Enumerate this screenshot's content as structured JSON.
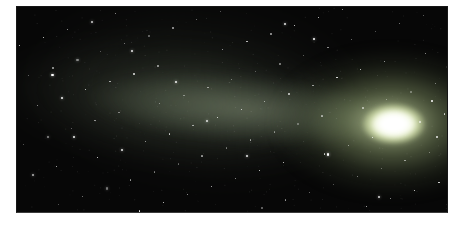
{
  "image": {
    "description": "Telescope photograph of a comet: a bright white-green coma on the right with a broad, diffuse gray-green tail fanning toward the upper left, set against a black sky densely speckled with faint stars. The photo sits inset on a white page with white margins.",
    "type": "astronomy-photograph",
    "subject": "comet"
  },
  "colors": {
    "page_bg": "#ffffff",
    "sky": "#070707",
    "tail_haze": "rgba(90,104,82,0.20)",
    "tail_outer": "rgba(106,120,96,0.30)",
    "tail_inner": "rgba(150,164,134,0.48)",
    "glow_inner": "rgba(210,224,174,0.88)",
    "glow_mid": "rgba(142,160,110,0.50)",
    "glow_outer": "rgba(70,82,55,0.25)",
    "coma_core": "#ffffff",
    "coma_mid": "#f3f8e3",
    "coma_edge": "rgba(205,218,165,0.85)",
    "star": "#ffffff"
  },
  "photo": {
    "frame": {
      "left": 16,
      "top": 6,
      "width": 432,
      "height": 207
    },
    "coma": {
      "cx": 378,
      "cy": 117,
      "core_w": 66,
      "core_h": 42,
      "core_blur": 2,
      "glow_cx": 368,
      "glow_cy": 115,
      "glow_w": 310,
      "glow_h": 195,
      "glow_blur": 6
    },
    "tail": {
      "inner": {
        "w": 430,
        "h": 96,
        "end_x": 392,
        "end_y": 115,
        "angle": 4.5,
        "blur": 6
      },
      "outer": {
        "w": 535,
        "h": 180,
        "end_x": 405,
        "end_y": 119,
        "angle": 5.5,
        "blur": 11
      },
      "haze": {
        "w": 480,
        "h": 250,
        "end_x": 396,
        "end_y": 110,
        "angle": 6.5,
        "blur": 16
      }
    }
  },
  "stars": [
    [
      61.8,
      75.5,
      1.1,
      0.9
    ],
    [
      23.6,
      51.0,
      1.1,
      0.5
    ],
    [
      85.4,
      26.5,
      1.1,
      0.7
    ],
    [
      47.2,
      2.0,
      1.1,
      0.4
    ],
    [
      9.0,
      77.4,
      1.5,
      0.8
    ],
    [
      70.8,
      52.9,
      1.1,
      0.55
    ],
    [
      32.6,
      28.4,
      1.8,
      0.65
    ],
    [
      94.4,
      3.9,
      1.1,
      0.45
    ],
    [
      56.2,
      79.4,
      1.1,
      0.95
    ],
    [
      18.0,
      54.9,
      1.5,
      0.6
    ],
    [
      79.8,
      30.4,
      1.1,
      0.9
    ],
    [
      41.6,
      5.9,
      1.1,
      0.5
    ],
    [
      3.4,
      81.3,
      2.2,
      0.7
    ],
    [
      65.2,
      56.8,
      1.8,
      0.4
    ],
    [
      27.0,
      32.3,
      1.5,
      0.8
    ],
    [
      88.9,
      7.8,
      1.1,
      0.55
    ],
    [
      50.7,
      83.3,
      1.1,
      0.65
    ],
    [
      12.5,
      58.8,
      1.1,
      0.45
    ],
    [
      74.3,
      34.3,
      1.1,
      0.95
    ],
    [
      36.1,
      9.8,
      1.5,
      0.6
    ],
    [
      97.9,
      85.2,
      1.8,
      0.9
    ],
    [
      59.7,
      60.7,
      1.1,
      0.5
    ],
    [
      21.5,
      36.2,
      1.1,
      0.7
    ],
    [
      83.3,
      11.7,
      1.1,
      0.4
    ],
    [
      45.1,
      87.2,
      1.5,
      0.8
    ],
    [
      6.9,
      62.7,
      2.2,
      0.55
    ],
    [
      68.7,
      38.2,
      1.1,
      0.65
    ],
    [
      30.5,
      13.7,
      1.8,
      0.45
    ],
    [
      92.3,
      89.1,
      1.1,
      0.95
    ],
    [
      54.1,
      64.6,
      1.5,
      0.6
    ],
    [
      15.9,
      40.1,
      1.1,
      0.9
    ],
    [
      77.7,
      15.6,
      1.1,
      0.5
    ],
    [
      39.5,
      91.1,
      1.1,
      0.7
    ],
    [
      1.3,
      66.6,
      1.1,
      0.4
    ],
    [
      63.1,
      42.1,
      1.8,
      0.8
    ],
    [
      24.9,
      17.6,
      1.1,
      0.55
    ],
    [
      86.7,
      93.0,
      1.1,
      0.65
    ],
    [
      48.5,
      68.5,
      1.1,
      0.45
    ],
    [
      10.3,
      44.0,
      2.2,
      0.95
    ],
    [
      72.1,
      19.5,
      1.5,
      0.6
    ],
    [
      33.9,
      95.0,
      1.1,
      0.9
    ],
    [
      95.7,
      70.5,
      1.8,
      0.5
    ],
    [
      57.5,
      46.0,
      1.1,
      0.7
    ],
    [
      19.3,
      21.5,
      1.1,
      0.4
    ],
    [
      81.1,
      96.9,
      1.5,
      0.8
    ],
    [
      42.9,
      72.4,
      1.1,
      0.55
    ],
    [
      4.7,
      47.9,
      1.1,
      0.65
    ],
    [
      66.5,
      23.4,
      1.1,
      0.45
    ],
    [
      28.3,
      98.9,
      1.8,
      0.95
    ],
    [
      90.1,
      74.4,
      1.5,
      0.6
    ],
    [
      52.0,
      49.9,
      1.1,
      0.9
    ],
    [
      13.8,
      25.4,
      2.2,
      0.5
    ],
    [
      75.6,
      0.9,
      1.1,
      0.7
    ],
    [
      37.4,
      76.3,
      1.1,
      0.4
    ],
    [
      99.2,
      51.8,
      1.5,
      0.8
    ],
    [
      61.0,
      27.3,
      1.8,
      0.55
    ],
    [
      22.8,
      2.8,
      1.1,
      0.65
    ],
    [
      84.6,
      78.3,
      1.1,
      0.45
    ],
    [
      46.4,
      53.8,
      1.1,
      0.95
    ],
    [
      8.2,
      29.3,
      1.5,
      0.6
    ],
    [
      70.0,
      4.8,
      1.1,
      0.9
    ],
    [
      31.8,
      80.2,
      1.1,
      0.5
    ],
    [
      93.6,
      55.7,
      1.8,
      0.7
    ],
    [
      55.4,
      31.2,
      1.1,
      0.4
    ],
    [
      17.2,
      6.7,
      2.2,
      0.8
    ],
    [
      79.0,
      82.2,
      1.1,
      0.55
    ],
    [
      40.8,
      57.7,
      1.1,
      0.65
    ],
    [
      2.6,
      33.2,
      1.1,
      0.45
    ],
    [
      64.4,
      8.7,
      1.1,
      0.95
    ],
    [
      26.2,
      84.1,
      1.8,
      0.6
    ],
    [
      88.0,
      59.6,
      1.1,
      0.9
    ],
    [
      49.8,
      35.1,
      1.1,
      0.5
    ],
    [
      11.6,
      10.6,
      1.1,
      0.7
    ],
    [
      73.5,
      86.1,
      1.1,
      0.4
    ],
    [
      35.3,
      61.6,
      1.5,
      0.8
    ],
    [
      97.1,
      37.1,
      1.1,
      0.55
    ],
    [
      58.9,
      12.6,
      1.8,
      0.65
    ],
    [
      20.7,
      88.0,
      2.2,
      0.45
    ],
    [
      82.5,
      63.5,
      1.1,
      0.95
    ],
    [
      44.3,
      39.0,
      1.5,
      0.6
    ],
    [
      6.1,
      14.5,
      1.1,
      0.9
    ],
    [
      67.9,
      90.0,
      1.1,
      0.5
    ],
    [
      29.7,
      65.5,
      1.1,
      0.7
    ],
    [
      91.5,
      41.0,
      1.8,
      0.4
    ],
    [
      53.3,
      16.5,
      1.5,
      0.8
    ],
    [
      15.1,
      92.0,
      1.1,
      0.55
    ],
    [
      76.9,
      67.4,
      1.1,
      0.65
    ],
    [
      38.7,
      42.9,
      1.1,
      0.45
    ],
    [
      0.5,
      18.4,
      1.1,
      0.95
    ],
    [
      62.3,
      93.9,
      1.5,
      0.6
    ],
    [
      24.1,
      69.4,
      2.2,
      0.9
    ],
    [
      85.9,
      44.9,
      1.1,
      0.5
    ],
    [
      47.7,
      20.4,
      1.1,
      0.7
    ],
    [
      9.5,
      95.9,
      1.1,
      0.4
    ],
    [
      71.3,
      71.3,
      1.5,
      0.8
    ],
    [
      33.1,
      46.8,
      1.1,
      0.55
    ],
    [
      94.9,
      22.3,
      1.1,
      0.65
    ],
    [
      56.7,
      97.8,
      1.8,
      0.45
    ],
    [
      18.5,
      73.3,
      1.1,
      0.95
    ],
    [
      80.3,
      48.8,
      1.5,
      0.6
    ],
    [
      7.9,
      32.5,
      2.6,
      1
    ],
    [
      68.8,
      15.0,
      2.4,
      1
    ],
    [
      36.8,
      35.9,
      2.2,
      0.95
    ],
    [
      53.2,
      72.3,
      2.2,
      0.9
    ],
    [
      72.0,
      71.4,
      2.4,
      1
    ],
    [
      26.5,
      21.0,
      2.0,
      0.9
    ],
    [
      84.0,
      92.0,
      2.0,
      0.85
    ],
    [
      13.0,
      63.0,
      2.2,
      0.95
    ],
    [
      62.0,
      8.0,
      2.0,
      0.9
    ],
    [
      44.0,
      55.0,
      2.0,
      0.85
    ],
    [
      96.3,
      45.6,
      1.6,
      0.9
    ],
    [
      97.5,
      63.0,
      1.4,
      0.8
    ]
  ],
  "grain": {
    "seed": 42,
    "count": 400
  }
}
